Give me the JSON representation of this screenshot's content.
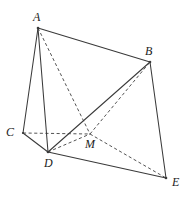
{
  "figure": {
    "canvas": {
      "width": 189,
      "height": 198
    },
    "background_color": "#ffffff",
    "stroke_color": "#3a3a3a",
    "dashed_stroke_color": "#4a4a4a",
    "label_color": "#1c1c1c",
    "vertices": [
      {
        "id": "A",
        "label": "A",
        "x": 38,
        "y": 28,
        "label_x": 33,
        "label_y": 11
      },
      {
        "id": "B",
        "label": "B",
        "x": 150,
        "y": 62,
        "label_x": 145,
        "label_y": 45
      },
      {
        "id": "C",
        "label": "C",
        "x": 23,
        "y": 133,
        "label_x": 6,
        "label_y": 126
      },
      {
        "id": "D",
        "label": "D",
        "x": 48,
        "y": 152,
        "label_x": 44,
        "label_y": 157
      },
      {
        "id": "M",
        "label": "M",
        "x": 90,
        "y": 134,
        "label_x": 85,
        "label_y": 138
      },
      {
        "id": "E",
        "label": "E",
        "x": 166,
        "y": 178,
        "label_x": 172,
        "label_y": 176
      }
    ],
    "edges_solid": [
      {
        "id": "A-B",
        "from": "A",
        "to": "B"
      },
      {
        "id": "A-C",
        "from": "A",
        "to": "C"
      },
      {
        "id": "A-D",
        "from": "A",
        "to": "D"
      },
      {
        "id": "C-D",
        "from": "C",
        "to": "D"
      },
      {
        "id": "D-B",
        "from": "D",
        "to": "B"
      },
      {
        "id": "D-E",
        "from": "D",
        "to": "E"
      },
      {
        "id": "B-E",
        "from": "B",
        "to": "E"
      }
    ],
    "edges_dashed": [
      {
        "id": "A-M",
        "from": "A",
        "to": "M"
      },
      {
        "id": "C-M",
        "from": "C",
        "to": "M"
      },
      {
        "id": "M-E",
        "from": "M",
        "to": "E"
      },
      {
        "id": "M-B",
        "from": "M",
        "to": "B"
      },
      {
        "id": "D-M",
        "from": "D",
        "to": "M"
      }
    ]
  }
}
